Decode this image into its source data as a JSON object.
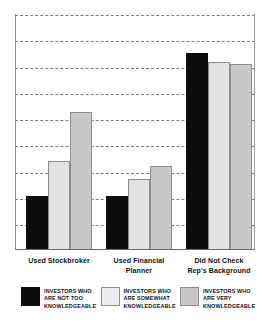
{
  "chart_data": {
    "type": "bar",
    "title": "",
    "subtitle": "",
    "xlabel": "",
    "ylabel": "",
    "grid": true,
    "gridline_count": 9,
    "ylim": [
      0,
      100
    ],
    "axis_tick_labels": [],
    "legend_position": "bottom",
    "categories": [
      "Used Stockbroker",
      "Used Financial\nPlanner",
      "Did Not Check\nRep's Background"
    ],
    "category_labels": [
      {
        "line1": "Used Stockbroker",
        "line2": ""
      },
      {
        "line1": "Used Financial",
        "line2": "Planner"
      },
      {
        "line1": "Did Not Check",
        "line2": "Rep's Background"
      }
    ],
    "series": [
      {
        "name": "INVESTORS WHO ARE NOT TOO KNOWLEDGEABLE",
        "color": "#0d0d0d",
        "values": [
          25,
          25,
          91
        ]
      },
      {
        "name": "INVESTORS WHO ARE SOMEWHAT KNOWLEDGEABLE",
        "color": "#e2e2e2",
        "values": [
          41,
          33,
          87
        ]
      },
      {
        "name": "INVESTORS WHO ARE VERY KNOWLEDGEABLE",
        "color": "#c8c8c8",
        "values": [
          64,
          39,
          86
        ]
      }
    ]
  },
  "legend": {
    "items": [
      {
        "swatch": "black-swatch",
        "line1": "INVESTORS WHO",
        "line2": "ARE NOT TOO",
        "line3": "KNOWLEDGEABLE"
      },
      {
        "swatch": "light-gray-swatch",
        "line1": "INVESTORS WHO",
        "line2": "ARE SOMEWHAT",
        "line3": "KNOWLEDGEABLE"
      },
      {
        "swatch": "gray-swatch",
        "line1": "INVESTORS WHO",
        "line2": "ARE VERY",
        "line3": "KNOWLEDGEABLE"
      }
    ]
  },
  "colors": {
    "series_not_too": "#0d0d0d",
    "series_somewhat": "#e2e2e2",
    "series_very": "#c8c8c8",
    "gridline": "#7d7d7d",
    "axis": "#6b6b6b",
    "text": "#111111",
    "background": "#ffffff"
  }
}
